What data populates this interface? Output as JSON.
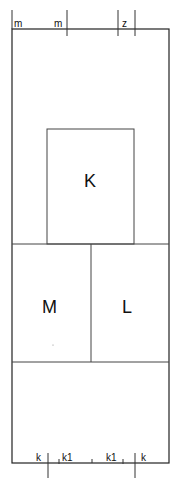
{
  "diagram": {
    "type": "floor-plan-schematic",
    "top_labels": [
      {
        "id": "m1",
        "text": "m",
        "x": 14,
        "y": 27
      },
      {
        "id": "m2",
        "text": "m",
        "x": 54,
        "y": 27
      },
      {
        "id": "z",
        "text": "z",
        "x": 122,
        "y": 27
      }
    ],
    "bottom_labels": [
      {
        "id": "k-left",
        "text": "k",
        "x": 36,
        "y": 461
      },
      {
        "id": "k1-left",
        "text": "k1",
        "x": 62,
        "y": 461
      },
      {
        "id": "k1-right",
        "text": "k1",
        "x": 106,
        "y": 461
      },
      {
        "id": "k-right",
        "text": "k",
        "x": 141,
        "y": 461
      }
    ],
    "rooms": [
      {
        "id": "K",
        "label": "K"
      },
      {
        "id": "M",
        "label": "M"
      },
      {
        "id": "L",
        "label": "L"
      }
    ],
    "colors": {
      "line": "#222222",
      "background": "#ffffff",
      "text": "#111111"
    }
  }
}
